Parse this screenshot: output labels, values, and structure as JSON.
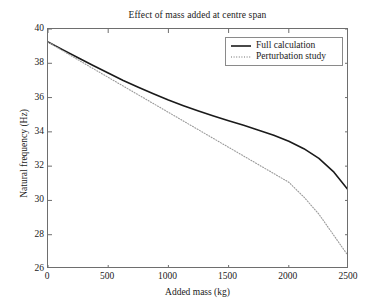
{
  "chart_data": {
    "type": "line",
    "title": "Effect of mass added at centre span",
    "xlabel": "Added mass (kg)",
    "ylabel": "Natural frequency (Hz)",
    "xlim": [
      0,
      2500
    ],
    "ylim": [
      26,
      40
    ],
    "xticks": [
      0,
      500,
      1000,
      1500,
      2000,
      2500
    ],
    "yticks": [
      26,
      28,
      30,
      32,
      34,
      36,
      38,
      40
    ],
    "xtick_labels": [
      "0",
      "500",
      "1000",
      "1500",
      "2000",
      "2500"
    ],
    "ytick_labels": [
      "26",
      "28",
      "30",
      "32",
      "34",
      "36",
      "38",
      "40"
    ],
    "grid": false,
    "legend_position": "upper right",
    "series": [
      {
        "name": "Full calculation",
        "style": "solid",
        "color": "#1a1a1a",
        "width": 1.6,
        "x": [
          0,
          125,
          250,
          375,
          500,
          625,
          750,
          875,
          1000,
          1125,
          1250,
          1375,
          1500,
          1625,
          1750,
          1875,
          2000,
          2125,
          2250,
          2375,
          2500
        ],
        "y": [
          39.25,
          38.78,
          38.32,
          37.87,
          37.43,
          37.0,
          36.6,
          36.22,
          35.86,
          35.53,
          35.22,
          34.93,
          34.65,
          34.38,
          34.1,
          33.8,
          33.45,
          33.02,
          32.45,
          31.65,
          30.55
        ]
      },
      {
        "name": "Perturbation study",
        "style": "dotted",
        "color": "#9a9a9a",
        "width": 1.1,
        "x": [
          0,
          125,
          250,
          375,
          500,
          625,
          750,
          875,
          1000,
          1125,
          1250,
          1375,
          1500,
          1625,
          1750,
          1875,
          2000,
          2125,
          2250,
          2375,
          2500
        ],
        "y": [
          39.25,
          38.72,
          38.2,
          37.69,
          37.18,
          36.67,
          36.16,
          35.65,
          35.14,
          34.63,
          34.12,
          33.61,
          33.1,
          32.59,
          32.08,
          31.57,
          31.06,
          30.2,
          29.2,
          27.95,
          26.7
        ]
      }
    ],
    "legend": [
      {
        "label": "Full calculation",
        "style": "solid"
      },
      {
        "label": "Perturbation study",
        "style": "dotted"
      }
    ]
  }
}
